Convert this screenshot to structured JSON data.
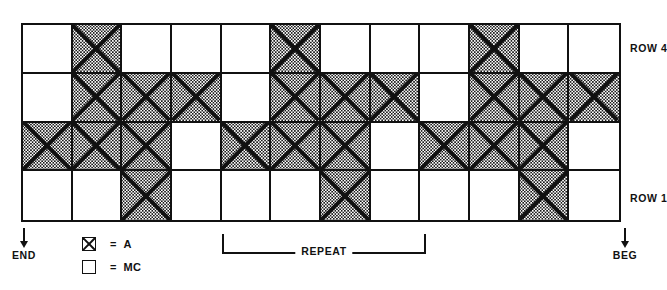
{
  "chart_data": {
    "type": "table",
    "title": "",
    "symbols": [
      "A",
      "MC"
    ],
    "rows": 4,
    "columns": 12,
    "row_labels": [
      "ROW 1",
      "ROW 4"
    ],
    "grid_top_to_bottom": [
      {
        "row": 4,
        "cells": [
          "MC",
          "A",
          "MC",
          "MC",
          "MC",
          "A",
          "MC",
          "MC",
          "MC",
          "A",
          "MC",
          "MC"
        ]
      },
      {
        "row": 3,
        "cells": [
          "MC",
          "A",
          "A",
          "A",
          "MC",
          "A",
          "A",
          "A",
          "MC",
          "A",
          "A",
          "A"
        ]
      },
      {
        "row": 2,
        "cells": [
          "A",
          "A",
          "A",
          "MC",
          "A",
          "A",
          "A",
          "MC",
          "A",
          "A",
          "A",
          "MC"
        ]
      },
      {
        "row": 1,
        "cells": [
          "MC",
          "MC",
          "A",
          "MC",
          "MC",
          "MC",
          "A",
          "MC",
          "MC",
          "MC",
          "A",
          "MC"
        ]
      }
    ],
    "legend": [
      {
        "symbol": "x-box",
        "equals": "=",
        "label": "A"
      },
      {
        "symbol": "empty-box",
        "equals": "=",
        "label": "MC"
      }
    ],
    "repeat": {
      "label": "REPEAT",
      "start_column": 5,
      "end_column": 8
    },
    "markers": {
      "left": "END",
      "right": "BEG"
    }
  },
  "labels": {
    "row_top": "ROW 4",
    "row_bottom": "ROW 1",
    "end": "END",
    "beg": "BEG",
    "repeat": "REPEAT",
    "legend_a_eq": "=",
    "legend_a_text": "A",
    "legend_mc_eq": "=",
    "legend_mc_text": "MC"
  },
  "colors": {
    "ink": "#111111",
    "paper": "#ffffff"
  }
}
